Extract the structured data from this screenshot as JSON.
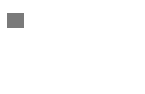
{
  "panel_label": "a",
  "colors": {
    "axis": "#444444",
    "line": "#555555",
    "label_bg": "#7a7a7a",
    "label_text": "#ffffff"
  },
  "chart_data": {
    "type": "line",
    "title": "",
    "xlabel": "",
    "ylabel": "",
    "x": [
      0,
      1,
      2
    ],
    "values": [
      0,
      5,
      2
    ],
    "ylim": [
      0,
      7
    ],
    "yticks": [
      0,
      1,
      2,
      3,
      4,
      5,
      6,
      7
    ],
    "ytick_labels": [],
    "xtick_labels": [],
    "grid": false,
    "legend": null
  }
}
